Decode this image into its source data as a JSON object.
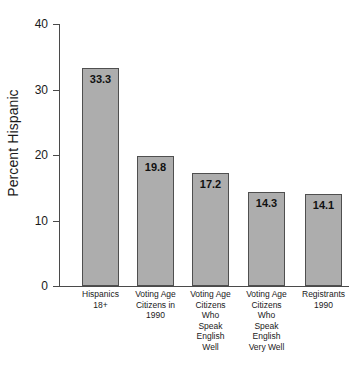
{
  "chart_data": {
    "type": "bar",
    "title": "",
    "xlabel": "",
    "ylabel": "Percent Hispanic",
    "ylim": [
      0,
      40
    ],
    "yticks": [
      0,
      10,
      20,
      30,
      40
    ],
    "ytick_labels": [
      "0",
      "10",
      "20",
      "30",
      "40"
    ],
    "grid": false,
    "legend": null,
    "categories": [
      "Hispanics\n18+",
      "Voting Age\nCitizens in\n1990",
      "Voting Age\nCitizens\nWho\nSpeak\nEnglish\nWell",
      "Voting Age\nCitizens\nWho\nSpeak\nEnglish\nVery Well",
      "Registrants\n1990"
    ],
    "values": [
      33.3,
      19.8,
      17.2,
      14.3,
      14.1
    ],
    "value_labels": [
      "33.3",
      "19.8",
      "17.2",
      "14.3",
      "14.1"
    ],
    "colors": {
      "bar_fill": "#adadad",
      "bar_stroke": "#4f4f4f",
      "axis": "#4a4a4a",
      "text": "#1a1a1a",
      "background": "#ffffff"
    }
  },
  "axis": {
    "y_title": "Percent Hispanic"
  }
}
